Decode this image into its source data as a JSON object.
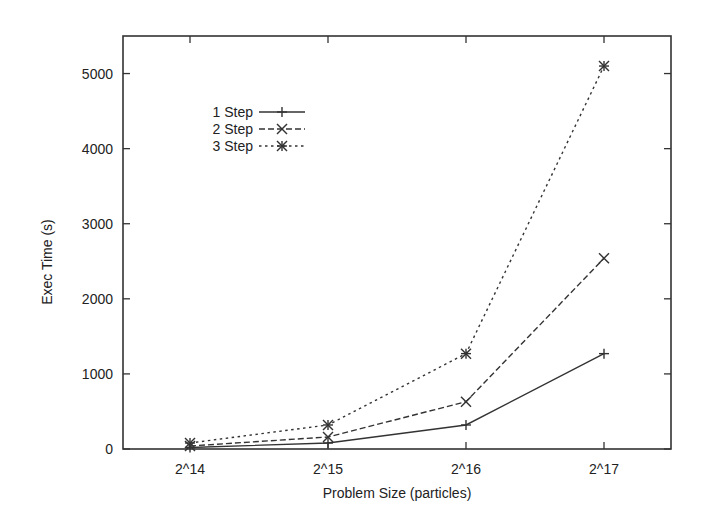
{
  "chart_data": {
    "type": "line",
    "title": "",
    "xlabel": "Problem Size (particles)",
    "ylabel": "Exec Time (s)",
    "categories": [
      "2^14",
      "2^15",
      "2^16",
      "2^17"
    ],
    "yticks": [
      0,
      1000,
      2000,
      3000,
      4000,
      5000
    ],
    "ylim": [
      0,
      5500
    ],
    "grid": false,
    "legend_position": "upper-left (inside)",
    "series": [
      {
        "name": "1 Step",
        "line_style": "solid",
        "marker": "plus",
        "values": [
          20,
          80,
          320,
          1270
        ]
      },
      {
        "name": "2 Step",
        "line_style": "dashed",
        "marker": "cross",
        "values": [
          40,
          160,
          630,
          2540
        ]
      },
      {
        "name": "3 Step",
        "line_style": "dotted",
        "marker": "asterisk",
        "values": [
          80,
          320,
          1270,
          5100
        ]
      }
    ]
  },
  "colors": {
    "line": "#333333",
    "frame": "#333333",
    "background": "#ffffff"
  }
}
